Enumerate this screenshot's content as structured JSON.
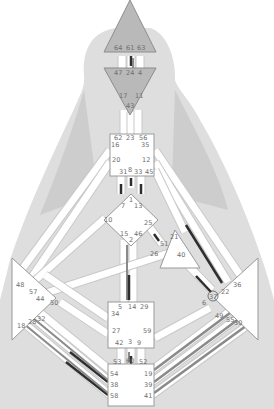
{
  "colors": {
    "background": "#ffffff",
    "silhouette": "#dcdcdc",
    "silhouette_dark": "#c6c6c6",
    "defined_center": "#b9b9b9",
    "open_center": "#ffffff",
    "personality_black": "#2e2e2e",
    "design_gray": "#8a8a8a",
    "channel": "#ffffff"
  },
  "centers": {
    "head": {
      "name": "Head",
      "defined": true,
      "gates": [
        "64",
        "61",
        "63"
      ]
    },
    "ajna": {
      "name": "Ajna",
      "defined": true,
      "gates": [
        "47",
        "24",
        "4",
        "17",
        "11",
        "43"
      ]
    },
    "throat": {
      "name": "Throat",
      "defined": false,
      "gates": [
        "62",
        "23",
        "56",
        "16",
        "35",
        "20",
        "12",
        "31",
        "8",
        "33",
        "45"
      ]
    },
    "g": {
      "name": "G",
      "defined": false,
      "gates": [
        "1",
        "7",
        "13",
        "10",
        "25",
        "15",
        "46",
        "2"
      ]
    },
    "heart": {
      "name": "Heart",
      "defined": false,
      "gates": [
        "21",
        "51",
        "26",
        "40"
      ]
    },
    "spleen": {
      "name": "Spleen",
      "defined": false,
      "gates": [
        "48",
        "57",
        "44",
        "50",
        "18",
        "28",
        "32"
      ]
    },
    "solar_plexus": {
      "name": "Solar Plexus",
      "defined": false,
      "gates": [
        "36",
        "22",
        "37",
        "6",
        "49",
        "55",
        "30"
      ]
    },
    "sacral": {
      "name": "Sacral",
      "defined": false,
      "gates": [
        "5",
        "14",
        "29",
        "34",
        "27",
        "59",
        "42",
        "3",
        "9"
      ]
    },
    "root": {
      "name": "Root",
      "defined": false,
      "gates": [
        "53",
        "60",
        "52",
        "54",
        "19",
        "38",
        "39",
        "58",
        "41"
      ]
    }
  },
  "highlighted_gate": "37",
  "active_gates": [
    {
      "gate": "61",
      "type": "personality"
    },
    {
      "gate": "24",
      "type": "design"
    },
    {
      "gate": "8",
      "type": "personality"
    },
    {
      "gate": "31",
      "type": "personality"
    },
    {
      "gate": "33",
      "type": "personality"
    },
    {
      "gate": "51",
      "type": "personality"
    },
    {
      "gate": "2",
      "type": "design"
    },
    {
      "gate": "14",
      "type": "personality"
    },
    {
      "gate": "22",
      "type": "personality"
    },
    {
      "gate": "37",
      "type": "personality"
    },
    {
      "gate": "3",
      "type": "design"
    },
    {
      "gate": "60",
      "type": "personality"
    },
    {
      "gate": "54",
      "type": "personality"
    },
    {
      "gate": "58",
      "type": "personality"
    },
    {
      "gate": "28",
      "type": "design"
    },
    {
      "gate": "18",
      "type": "design"
    },
    {
      "gate": "19",
      "type": "design"
    },
    {
      "gate": "39",
      "type": "design"
    },
    {
      "gate": "41",
      "type": "design"
    },
    {
      "gate": "49",
      "type": "design"
    },
    {
      "gate": "55",
      "type": "design"
    },
    {
      "gate": "30",
      "type": "design"
    }
  ]
}
